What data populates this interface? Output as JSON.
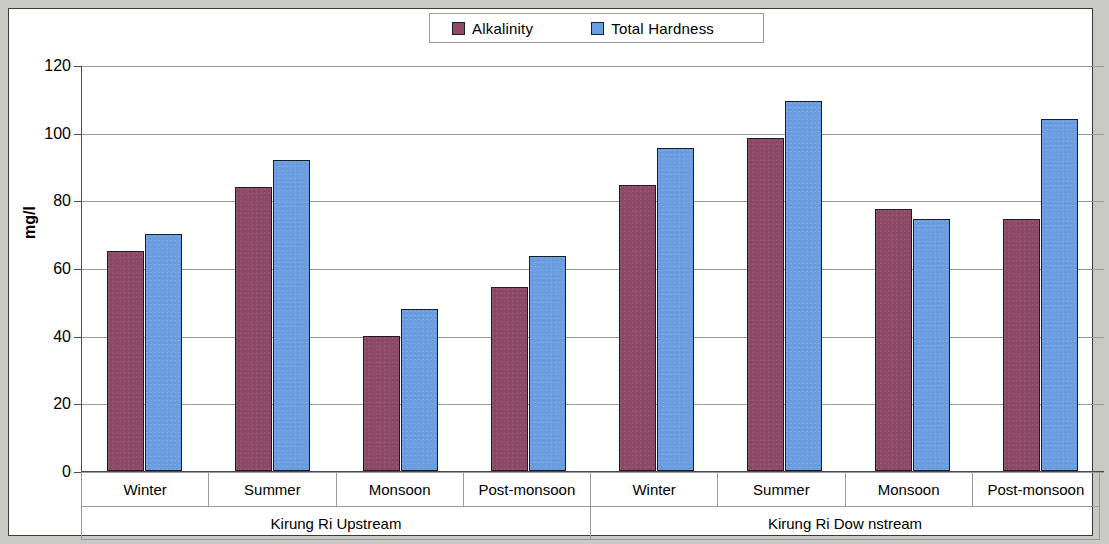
{
  "chart_data": {
    "type": "bar",
    "title": "",
    "xlabel": "",
    "ylabel": "mg/l",
    "ylim": [
      0,
      120
    ],
    "ytick_step": 20,
    "yticks": [
      0,
      20,
      40,
      60,
      80,
      100,
      120
    ],
    "grid": true,
    "legend_position": "top-center",
    "categories": [
      "Winter",
      "Summer",
      "Monsoon",
      "Post-monsoon",
      "Winter",
      "Summer",
      "Monsoon",
      "Post-monsoon"
    ],
    "groups": [
      {
        "label": "Kirung Ri Upstream",
        "span": 4
      },
      {
        "label": "Kirung Ri Dow nstream",
        "span": 4
      }
    ],
    "series": [
      {
        "name": "Alkalinity",
        "color": "#8f4a66",
        "values": [
          65,
          84,
          40,
          54.5,
          84.5,
          98.5,
          77.5,
          74.5
        ]
      },
      {
        "name": "Total Hardness",
        "color": "#6a9ee0",
        "values": [
          70,
          92,
          48,
          63.5,
          95.5,
          109.5,
          74.5,
          104
        ]
      }
    ]
  },
  "legend": {
    "entries": [
      {
        "label": "Alkalinity",
        "color": "#8f4a66"
      },
      {
        "label": "Total Hardness",
        "color": "#6a9ee0"
      }
    ]
  },
  "colors": {
    "alkalinity": "#8f4a66",
    "total_hardness": "#6a9ee0",
    "grid": "#9a9a9a",
    "border": "#3a3a3a",
    "page_background": "#c8c8c4"
  }
}
